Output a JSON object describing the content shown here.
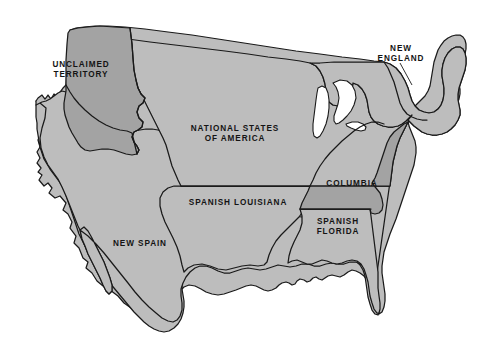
{
  "map": {
    "title": "Alternate History Map of North America",
    "background_color": "#ffffff",
    "border_color": "#1a1a1a",
    "fill_light": "#bdbdbd",
    "fill_dark": "#a3a3a3",
    "lake_color": "#ffffff"
  },
  "regions": [
    {
      "id": "unclaimed-territory",
      "label": "UNCLAIMED\nTERRITORY",
      "label_lines": [
        "UNCLAIMED",
        "TERRITORY"
      ],
      "shade": "dark",
      "fill": "#a3a3a3",
      "label_x": 48,
      "label_y": 62,
      "font_size": 8.2
    },
    {
      "id": "national-states-of-america",
      "label": "NATIONAL STATES\nOF AMERICA",
      "label_lines": [
        "NATIONAL STATES",
        "OF AMERICA"
      ],
      "shade": "light",
      "fill": "#bdbdbd",
      "label_x": 192,
      "label_y": 125,
      "font_size": 8.2
    },
    {
      "id": "new-england",
      "label": "NEW\nENGLAND",
      "label_lines": [
        "NEW",
        "ENGLAND"
      ],
      "shade": "light",
      "fill": "#bdbdbd",
      "label_x": 379,
      "label_y": 45,
      "font_size": 8.2,
      "label_outside": true
    },
    {
      "id": "columbia",
      "label": "COLUMBIA",
      "label_lines": [
        "COLUMBIA"
      ],
      "shade": "dark",
      "fill": "#a3a3a3",
      "label_x": 341,
      "label_y": 180,
      "font_size": 8.2
    },
    {
      "id": "spanish-louisiana",
      "label": "SPANISH LOUISIANA",
      "label_lines": [
        "SPANISH LOUISIANA"
      ],
      "shade": "light",
      "fill": "#bdbdbd",
      "label_x": 193,
      "label_y": 199,
      "font_size": 8.2
    },
    {
      "id": "spanish-florida",
      "label": "SPANISH\nFLORIDA",
      "label_lines": [
        "SPANISH",
        "FLORIDA"
      ],
      "shade": "light",
      "fill": "#bdbdbd",
      "label_x": 310,
      "label_y": 219,
      "font_size": 8.2
    },
    {
      "id": "new-spain",
      "label": "NEW SPAIN",
      "label_lines": [
        "NEW SPAIN"
      ],
      "shade": "light",
      "fill": "#bdbdbd",
      "label_x": 130,
      "label_y": 240,
      "font_size": 8.2
    }
  ],
  "water_bodies": [
    {
      "id": "lake-michigan",
      "name": "lake-michigan"
    },
    {
      "id": "lake-huron",
      "name": "lake-huron"
    },
    {
      "id": "gulf-of-california",
      "name": "gulf-of-california"
    }
  ],
  "annotations": [
    {
      "id": "new-england-leader",
      "name": "new-england-leader-line"
    }
  ]
}
